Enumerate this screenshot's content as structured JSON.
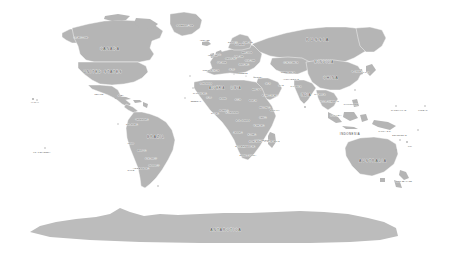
{
  "map": {
    "title": "World Political Map",
    "projection": "robinson",
    "background_color": "#ffffff",
    "land_color": "#b5b5b5",
    "border_color": "#ffffff",
    "label_color": "#3a3a3a",
    "width": 461,
    "height": 257
  },
  "continent_labels": [
    {
      "name": "RUSSIA",
      "text": "RUSSIA",
      "x": 318,
      "y": 40,
      "size": "lbl-l"
    },
    {
      "name": "CHINA",
      "text": "CHINA",
      "x": 331,
      "y": 78,
      "size": "lbl-m"
    },
    {
      "name": "CANADA",
      "text": "CANADA",
      "x": 110,
      "y": 49,
      "size": "lbl-m"
    },
    {
      "name": "UNITED STATES",
      "text": "UNITED STATES",
      "x": 103,
      "y": 72,
      "size": "lbl-m"
    },
    {
      "name": "BRAZIL",
      "text": "BRAZIL",
      "x": 156,
      "y": 137,
      "size": "lbl-m"
    },
    {
      "name": "AUSTRALIA",
      "text": "AUSTRALIA",
      "x": 373,
      "y": 161,
      "size": "lbl-m"
    },
    {
      "name": "ANTARCTICA",
      "text": "ANTARCTICA",
      "x": 226,
      "y": 230,
      "size": "lbl-m"
    },
    {
      "name": "INDIA",
      "text": "INDIA",
      "x": 306,
      "y": 95,
      "size": "lbl-s"
    },
    {
      "name": "MONGOLIA",
      "text": "MONGOLIA",
      "x": 324,
      "y": 62,
      "size": "lbl-s"
    },
    {
      "name": "INDONESIA",
      "text": "INDONESIA",
      "x": 350,
      "y": 134,
      "size": "lbl-s"
    },
    {
      "name": "GREENLAND",
      "text": "GREENLAND",
      "x": 185,
      "y": 25,
      "size": "lbl-xs"
    },
    {
      "name": "ALGERIA",
      "text": "ALGERIA",
      "x": 217,
      "y": 88,
      "size": "lbl-s"
    },
    {
      "name": "LIBYA",
      "text": "LIBYA",
      "x": 236,
      "y": 88,
      "size": "lbl-s"
    },
    {
      "name": "EGYPT",
      "text": "EGYPT",
      "x": 257,
      "y": 89,
      "size": "lbl-xs"
    },
    {
      "name": "SAUDI ARABIA",
      "text": "SAUDI ARABIA",
      "x": 270,
      "y": 95,
      "size": "lbl-xxs"
    },
    {
      "name": "IRAN",
      "text": "IRAN",
      "x": 281,
      "y": 85,
      "size": "lbl-xxs"
    },
    {
      "name": "KAZAKHSTAN",
      "text": "KAZAKHSTAN",
      "x": 291,
      "y": 62,
      "size": "lbl-xxs"
    },
    {
      "name": "TURKEY",
      "text": "TURKEY",
      "x": 258,
      "y": 77,
      "size": "lbl-xxs"
    },
    {
      "name": "SUDAN",
      "text": "SUDAN",
      "x": 253,
      "y": 100,
      "size": "lbl-xxs"
    },
    {
      "name": "CHAD",
      "text": "CHAD",
      "x": 238,
      "y": 99,
      "size": "lbl-xxs"
    },
    {
      "name": "NIGER",
      "text": "NIGER",
      "x": 223,
      "y": 98,
      "size": "lbl-xxs"
    },
    {
      "name": "MALI",
      "text": "MALI",
      "x": 209,
      "y": 97,
      "size": "lbl-xxs"
    },
    {
      "name": "MAURITANIA",
      "text": "MAURITANIA",
      "x": 200,
      "y": 93,
      "size": "lbl-xxs"
    },
    {
      "name": "NIGERIA",
      "text": "NIGERIA",
      "x": 224,
      "y": 110,
      "size": "lbl-xxs"
    },
    {
      "name": "ETHIOPIA",
      "text": "ETHIOPIA",
      "x": 265,
      "y": 107,
      "size": "lbl-xxs"
    },
    {
      "name": "SOMALIA",
      "text": "SOMALIA",
      "x": 275,
      "y": 110,
      "size": "lbl-xxs"
    },
    {
      "name": "KENYA",
      "text": "KENYA",
      "x": 263,
      "y": 117,
      "size": "lbl-xxs"
    },
    {
      "name": "DR CONGO",
      "text": "D.R. CONGO",
      "x": 243,
      "y": 120,
      "size": "lbl-xxs"
    },
    {
      "name": "TANZANIA",
      "text": "TANZANIA",
      "x": 259,
      "y": 125,
      "size": "lbl-xxs"
    },
    {
      "name": "ANGOLA",
      "text": "ANGOLA",
      "x": 238,
      "y": 132,
      "size": "lbl-xxs"
    },
    {
      "name": "ZAMBIA",
      "text": "ZAMBIA",
      "x": 252,
      "y": 134,
      "size": "lbl-xxs"
    },
    {
      "name": "NAMIBIA",
      "text": "NAMIBIA",
      "x": 240,
      "y": 146,
      "size": "lbl-xxs"
    },
    {
      "name": "BOTSWANA",
      "text": "BOTSWANA",
      "x": 249,
      "y": 146,
      "size": "lbl-xxs"
    },
    {
      "name": "MADAGASCAR",
      "text": "MADAGASCAR",
      "x": 272,
      "y": 141,
      "size": "lbl-xxs"
    },
    {
      "name": "SOUTH AFRICA",
      "text": "SOUTH AFRICA",
      "x": 248,
      "y": 155,
      "size": "lbl-xxs"
    },
    {
      "name": "ARGENTINA",
      "text": "ARGENTINA",
      "x": 141,
      "y": 168,
      "size": "lbl-xs"
    },
    {
      "name": "CHILE",
      "text": "CHILE",
      "x": 131,
      "y": 170,
      "size": "lbl-xxs"
    },
    {
      "name": "PERU",
      "text": "PERU",
      "x": 131,
      "y": 143,
      "size": "lbl-xxs"
    },
    {
      "name": "BOLIVIA",
      "text": "BOLIVIA",
      "x": 142,
      "y": 150,
      "size": "lbl-xxs"
    },
    {
      "name": "COLOMBIA",
      "text": "COLOMBIA",
      "x": 132,
      "y": 124,
      "size": "lbl-xxs"
    },
    {
      "name": "VENEZUELA",
      "text": "VENEZUELA",
      "x": 142,
      "y": 119,
      "size": "lbl-xxs"
    },
    {
      "name": "PARAGUAY",
      "text": "PARAGUAY",
      "x": 151,
      "y": 158,
      "size": "lbl-xxs"
    },
    {
      "name": "URUGUAY",
      "text": "URUGUAY",
      "x": 154,
      "y": 165,
      "size": "lbl-xxs"
    },
    {
      "name": "MEXICO",
      "text": "MEXICO",
      "x": 99,
      "y": 94,
      "size": "lbl-xxs"
    },
    {
      "name": "ALASKA",
      "text": "ALASKA (US)",
      "x": 81,
      "y": 37,
      "size": "lbl-xxs"
    },
    {
      "name": "PAKISTAN",
      "text": "PAKISTAN",
      "x": 296,
      "y": 86,
      "size": "lbl-xxs"
    },
    {
      "name": "AFGHANISTAN",
      "text": "AFGHANISTAN",
      "x": 291,
      "y": 79,
      "size": "lbl-xxs"
    },
    {
      "name": "MYANMAR",
      "text": "MYANMAR",
      "x": 320,
      "y": 94,
      "size": "lbl-xxs"
    },
    {
      "name": "THAILAND",
      "text": "THAILAND",
      "x": 326,
      "y": 101,
      "size": "lbl-xxs"
    },
    {
      "name": "VIETNAM",
      "text": "VIETNAM",
      "x": 334,
      "y": 101,
      "size": "lbl-xxs"
    },
    {
      "name": "PHILIPPINES",
      "text": "PHILIPPINES",
      "x": 351,
      "y": 104,
      "size": "lbl-xxs"
    },
    {
      "name": "MALAYSIA",
      "text": "MALAYSIA",
      "x": 336,
      "y": 115,
      "size": "lbl-xxs"
    },
    {
      "name": "JAPAN",
      "text": "JAPAN",
      "x": 366,
      "y": 72,
      "size": "lbl-xxs"
    },
    {
      "name": "SOUTH KOREA",
      "text": "S. KOREA",
      "x": 357,
      "y": 71,
      "size": "lbl-xxs"
    },
    {
      "name": "PAPUA",
      "text": "PAPUA N.G.",
      "x": 385,
      "y": 131,
      "size": "lbl-xxs"
    },
    {
      "name": "NEW ZEALAND",
      "text": "NEW ZEALAND",
      "x": 404,
      "y": 181,
      "size": "lbl-xxs"
    },
    {
      "name": "NORWAY",
      "text": "NORWAY",
      "x": 233,
      "y": 42,
      "size": "lbl-xxs"
    },
    {
      "name": "SWEDEN",
      "text": "SWEDEN",
      "x": 240,
      "y": 44,
      "size": "lbl-xxs"
    },
    {
      "name": "FINLAND",
      "text": "FINLAND",
      "x": 248,
      "y": 42,
      "size": "lbl-xxs"
    },
    {
      "name": "ICELAND",
      "text": "ICELAND",
      "x": 205,
      "y": 40,
      "size": "lbl-xxs"
    },
    {
      "name": "UNITED KINGDOM",
      "text": "U.K.",
      "x": 219,
      "y": 54,
      "size": "lbl-xxs"
    },
    {
      "name": "IRELAND",
      "text": "IRELAND",
      "x": 213,
      "y": 55,
      "size": "lbl-xxs"
    },
    {
      "name": "FRANCE",
      "text": "FRANCE",
      "x": 222,
      "y": 62,
      "size": "lbl-xxs"
    },
    {
      "name": "SPAIN",
      "text": "SPAIN",
      "x": 216,
      "y": 70,
      "size": "lbl-xxs"
    },
    {
      "name": "PORTUGAL",
      "text": "PORTUGAL",
      "x": 209,
      "y": 70,
      "size": "lbl-xxs"
    },
    {
      "name": "GERMANY",
      "text": "GERMANY",
      "x": 231,
      "y": 58,
      "size": "lbl-xxs"
    },
    {
      "name": "POLAND",
      "text": "POLAND",
      "x": 239,
      "y": 56,
      "size": "lbl-xxs"
    },
    {
      "name": "UKRAINE",
      "text": "UKRAINE",
      "x": 250,
      "y": 60,
      "size": "lbl-xxs"
    },
    {
      "name": "ITALY",
      "text": "ITALY",
      "x": 232,
      "y": 69,
      "size": "lbl-xxs"
    },
    {
      "name": "ROMANIA",
      "text": "ROMANIA",
      "x": 244,
      "y": 64,
      "size": "lbl-xxs"
    },
    {
      "name": "BELARUS",
      "text": "BELARUS",
      "x": 247,
      "y": 52,
      "size": "lbl-xxs"
    },
    {
      "name": "GREECE",
      "text": "GREECE",
      "x": 243,
      "y": 73,
      "size": "lbl-xxs"
    },
    {
      "name": "MOROCCO",
      "text": "MOROCCO",
      "x": 206,
      "y": 83,
      "size": "lbl-xxs"
    },
    {
      "name": "IRAQ",
      "text": "IRAQ",
      "x": 268,
      "y": 83,
      "size": "lbl-xxs"
    },
    {
      "name": "UZBEKISTAN",
      "text": "UZBEKISTAN",
      "x": 288,
      "y": 72,
      "size": "lbl-xxs"
    },
    {
      "name": "CUBA",
      "text": "CUBA",
      "x": 121,
      "y": 95,
      "size": "lbl-xxs"
    },
    {
      "name": "PACIFIC-ISLAND",
      "text": "FR. POLYNESIA",
      "x": 42,
      "y": 152,
      "size": "lbl-xxs"
    },
    {
      "name": "HAWAII",
      "text": "HAWAII",
      "x": 35,
      "y": 102,
      "size": "lbl-xxs"
    },
    {
      "name": "MARSHALL",
      "text": "MARSHALL IS.",
      "x": 399,
      "y": 110,
      "size": "lbl-xxs"
    },
    {
      "name": "KIRIBATI",
      "text": "KIRIBATI",
      "x": 423,
      "y": 110,
      "size": "lbl-xxs"
    },
    {
      "name": "FIJI",
      "text": "FIJI",
      "x": 410,
      "y": 146,
      "size": "lbl-xxs"
    },
    {
      "name": "SOLOMON",
      "text": "SOLOMON IS.",
      "x": 400,
      "y": 135,
      "size": "lbl-xxs"
    },
    {
      "name": "GUINEA-BISSAU",
      "text": "SENEGAL",
      "x": 196,
      "y": 101,
      "size": "lbl-xxs"
    },
    {
      "name": "GHANA",
      "text": "GHANA",
      "x": 215,
      "y": 113,
      "size": "lbl-xxs"
    },
    {
      "name": "CAMEROON",
      "text": "CAMEROON",
      "x": 232,
      "y": 112,
      "size": "lbl-xxs"
    },
    {
      "name": "MOZAMBIQUE",
      "text": "MOZAMBIQUE",
      "x": 262,
      "y": 140,
      "size": "lbl-xxs"
    },
    {
      "name": "ZIMBABWE",
      "text": "ZIMBABWE",
      "x": 255,
      "y": 141,
      "size": "lbl-xxs"
    }
  ]
}
